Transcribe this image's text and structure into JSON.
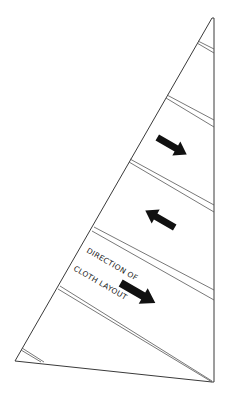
{
  "diagram": {
    "colors": {
      "background": "#ffffff",
      "outline": "#3a3a3a",
      "seam": "#555555",
      "arrow": "#111111"
    },
    "sail_outline": {
      "head": [
        212,
        18
      ],
      "clew": [
        212,
        382
      ],
      "tack": [
        15,
        361
      ]
    },
    "seams": [
      {
        "leech_point": [
          198,
          42
        ],
        "luff_point": [
          214,
          52
        ],
        "gap": 2
      },
      {
        "leech_point": [
          166,
          96
        ],
        "luff_point": [
          214,
          126
        ],
        "gap": 3
      },
      {
        "leech_point": [
          130,
          160
        ],
        "luff_point": [
          214,
          212
        ],
        "gap": 3
      },
      {
        "leech_point": [
          93,
          228
        ],
        "luff_point": [
          214,
          298
        ],
        "gap": 3
      },
      {
        "leech_point": [
          59,
          287
        ],
        "luff_point": [
          212,
          380
        ],
        "gap": 3
      },
      {
        "leech_point": [
          22,
          349
        ],
        "luff_point": [
          44,
          363
        ],
        "gap": 2
      }
    ],
    "arrows": [
      {
        "name": "arrow-down-right-upper",
        "direction": "down-right",
        "cx": 172,
        "cy": 145
      },
      {
        "name": "arrow-up-left-middle",
        "direction": "up-left",
        "cx": 160,
        "cy": 220
      },
      {
        "name": "arrow-down-right-lower",
        "direction": "down-right",
        "cx": 138,
        "cy": 293
      }
    ],
    "label": {
      "line1": "DIRECTION OF",
      "line2": "CLOTH LAYOUT"
    }
  }
}
